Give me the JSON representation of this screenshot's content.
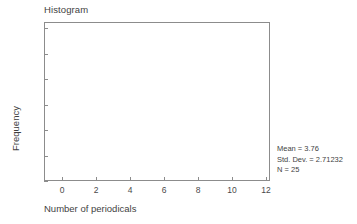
{
  "chart": {
    "title": "Histogram"
  },
  "axes": {
    "x_title": "Number of periodicals",
    "y_title": "Frequency"
  },
  "stats": {
    "mean": "Mean = 3.76",
    "std_dev": "Std. Dev. = 2.71232",
    "n": "N = 25"
  },
  "chart_data": {
    "type": "bar",
    "title": "Histogram",
    "xlabel": "Number of periodicals",
    "ylabel": "Frequency",
    "xlim": [
      -0.7,
      12.7
    ],
    "ylim": [
      0,
      6.3
    ],
    "xticks": [
      0,
      2,
      4,
      6,
      8,
      10,
      12
    ],
    "xtick_labels": [
      "0",
      "2",
      "4",
      "6",
      "8",
      "10",
      "12"
    ],
    "yticks": [
      0,
      1,
      2,
      3,
      4,
      5,
      6
    ],
    "ytick_labels": [
      "0",
      "1",
      "2",
      "3",
      "4",
      "5",
      "6"
    ],
    "grid": false,
    "legend": false,
    "bars": [],
    "values": [],
    "categories": [],
    "annotations": [
      "Mean = 3.76",
      "Std. Dev. = 2.71232",
      "N = 25"
    ],
    "statistics": {
      "mean": 3.76,
      "std_dev": 2.71232,
      "n": 25
    },
    "colors": {
      "axis": "#8c8c8c",
      "text": "#3f3f3f",
      "background": "#ffffff",
      "bar": "#7d7d7d"
    }
  }
}
